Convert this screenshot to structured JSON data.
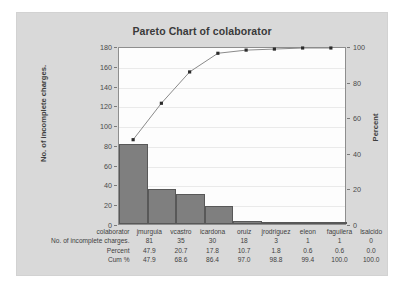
{
  "chart_data": {
    "type": "bar",
    "title": "Pareto Chart of colaborator",
    "xlabel": "colaborator",
    "ylabel": "No. of incomplete charges.",
    "y2label": "Percent",
    "categories": [
      "jmurguia",
      "vcastro",
      "icardona",
      "oruiz",
      "jrodriguez",
      "eleon",
      "faguilera",
      "lsalcido"
    ],
    "values": [
      81,
      35,
      30,
      18,
      3,
      1,
      1,
      0
    ],
    "percent": [
      "47.9",
      "20.7",
      "17.8",
      "10.7",
      "1.8",
      "0.6",
      "0.6",
      "0.0"
    ],
    "cum_percent": [
      "47.9",
      "68.6",
      "86.4",
      "97.0",
      "98.8",
      "99.4",
      "100.0",
      "100.0"
    ],
    "cum_percent_values": [
      47.9,
      68.6,
      86.4,
      97.0,
      98.8,
      99.4,
      100.0,
      100.0
    ],
    "ylim": [
      0,
      180
    ],
    "yticks": [
      0,
      20,
      40,
      60,
      80,
      100,
      120,
      140,
      160,
      180
    ],
    "y2lim": [
      0,
      100
    ],
    "y2ticks": [
      0,
      20,
      40,
      60,
      80,
      100
    ],
    "grid": true,
    "legend": "none",
    "series": [
      {
        "name": "No. of incomplete charges.",
        "type": "bar",
        "values": [
          81,
          35,
          30,
          18,
          3,
          1,
          1,
          0
        ]
      },
      {
        "name": "Cum %",
        "type": "line",
        "values": [
          47.9,
          68.6,
          86.4,
          97.0,
          98.8,
          99.4,
          100.0,
          100.0
        ]
      }
    ],
    "colors": {
      "bar_fill": "#7f7f7f",
      "bar_edge": "#585858",
      "line": "#8a8a8a",
      "marker": "#2b2b2b",
      "panel_background": "#d9d9d9",
      "plot_background": "#fdfdfd"
    }
  },
  "table": {
    "row_labels": [
      "colaborator",
      "No. of incomplete charges.",
      "Percent",
      "Cum %"
    ]
  }
}
